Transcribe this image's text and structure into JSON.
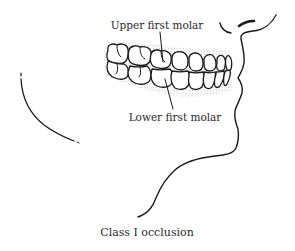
{
  "figure": {
    "type": "dental-occlusion-illustration",
    "labels": {
      "upper_molar": "Upper first molar",
      "lower_molar": "Lower first molar",
      "caption": "Class I occlusion"
    },
    "colors": {
      "ink": "#1a1a1a",
      "text": "#2a2a2a",
      "gum_stipple": "#9a9a9a",
      "background": "#ffffff"
    }
  }
}
